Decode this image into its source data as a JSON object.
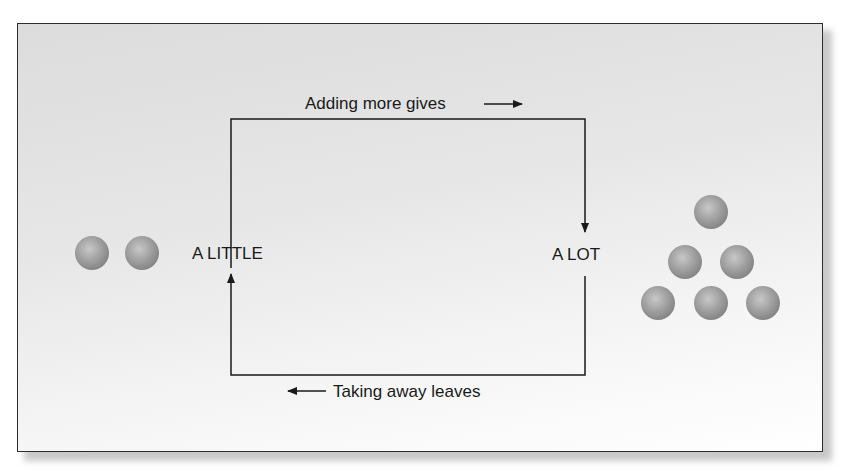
{
  "diagram": {
    "top_label": "Adding more gives",
    "bottom_label": "Taking away leaves",
    "left_state": "A LITTLE",
    "right_state": "A LOT",
    "left_ball_count": 2,
    "right_ball_count": 6,
    "colors": {
      "line": "#1a1a1a",
      "ball_base": "#8e8e8e",
      "ball_highlight": "#c4c4c4",
      "panel_border": "#2c2c2c"
    }
  }
}
